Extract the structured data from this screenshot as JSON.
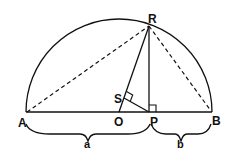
{
  "diagram": {
    "points": {
      "A": {
        "label": "A"
      },
      "B": {
        "label": "B"
      },
      "O": {
        "label": "O"
      },
      "P": {
        "label": "P"
      },
      "R": {
        "label": "R"
      },
      "S": {
        "label": "S"
      }
    },
    "segments": {
      "a": {
        "label": "a"
      },
      "b": {
        "label": "b"
      }
    },
    "colors": {
      "stroke": "#111111",
      "background": "#ffffff"
    }
  }
}
